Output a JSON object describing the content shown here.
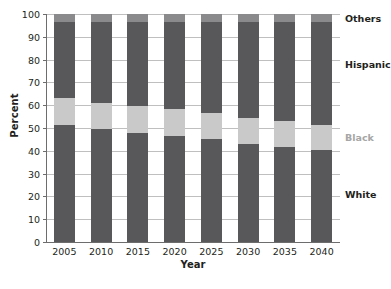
{
  "chart_data": {
    "type": "bar",
    "subtype": "stacked-bar-100-percent",
    "title": "",
    "xlabel": "Year",
    "ylabel": "Percent",
    "categories": [
      "2005",
      "2010",
      "2015",
      "2020",
      "2025",
      "2030",
      "2035",
      "2040"
    ],
    "ylim": [
      0,
      100
    ],
    "yticks": [
      0,
      10,
      20,
      30,
      40,
      50,
      60,
      70,
      80,
      90,
      100
    ],
    "grid": true,
    "legend_position": "right-outside",
    "stack_order_bottom_to_top": [
      "White",
      "Black",
      "Hispanic",
      "Others"
    ],
    "series": [
      {
        "name": "White",
        "color": "#58585a",
        "values": [
          51.5,
          49.5,
          48.0,
          46.5,
          45.0,
          43.0,
          41.5,
          40.5
        ]
      },
      {
        "name": "Black",
        "color": "#c9c9c9",
        "values": [
          11.5,
          11.5,
          11.5,
          12.0,
          11.5,
          11.5,
          11.5,
          11.0
        ]
      },
      {
        "name": "Hispanic",
        "color": "#58585a",
        "values": [
          33.5,
          35.5,
          37.0,
          38.0,
          40.0,
          42.0,
          43.5,
          45.0
        ]
      },
      {
        "name": "Others",
        "color": "#8a8a8c",
        "values": [
          3.5,
          3.5,
          3.5,
          3.5,
          3.5,
          3.5,
          3.5,
          3.5
        ]
      }
    ],
    "cumulative_tops": {
      "White": [
        51.5,
        49.5,
        48.0,
        46.5,
        45.0,
        43.0,
        41.5,
        40.5
      ],
      "Black": [
        63.0,
        61.0,
        59.5,
        58.5,
        56.5,
        54.5,
        53.0,
        51.5
      ],
      "Hispanic": [
        96.5,
        96.5,
        96.5,
        96.5,
        96.5,
        96.5,
        96.5,
        96.5
      ],
      "Others": [
        100,
        100,
        100,
        100,
        100,
        100,
        100,
        100
      ]
    },
    "legend_entries": [
      {
        "label": "Others",
        "color": "#231f20",
        "at_percent": 98.3
      },
      {
        "label": "Hispanic",
        "color": "#231f20",
        "at_percent": 78.0
      },
      {
        "label": "Black",
        "color": "#a6a6a6",
        "at_percent": 46.0
      },
      {
        "label": "White",
        "color": "#231f20",
        "at_percent": 21.0
      }
    ]
  },
  "axis": {
    "y_title": "Percent",
    "x_title": "Year",
    "y_tick_labels": [
      "0",
      "10",
      "20",
      "30",
      "40",
      "50",
      "60",
      "70",
      "80",
      "90",
      "100"
    ],
    "x_tick_labels": [
      "2005",
      "2010",
      "2015",
      "2020",
      "2025",
      "2030",
      "2035",
      "2040"
    ]
  },
  "colors": {
    "dark_gray": "#58585a",
    "mid_gray": "#8a8a8c",
    "light_gray": "#c9c9c9",
    "gridline": "#bfbfbf",
    "axis": "#6d6d6d",
    "text": "#231f20",
    "background": "#ffffff"
  }
}
